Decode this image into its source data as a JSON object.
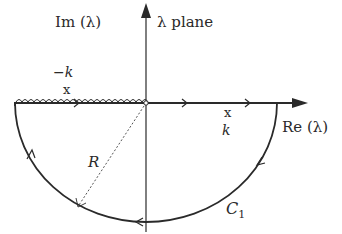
{
  "diagram": {
    "type": "complex-plane contour",
    "plane_label": "λ plane",
    "axes": {
      "imaginary_label": "Im (λ)",
      "real_label": "Re (λ)"
    },
    "points": [
      {
        "label": "−k",
        "marker": "x",
        "position": "negative real axis"
      },
      {
        "label": "k",
        "marker": "x",
        "position": "positive real axis"
      }
    ],
    "contour": {
      "name": "C",
      "subscript": "1",
      "description": "Lower semicircle of radius R, closed along real axis, branch cut (wavy) on negative real axis",
      "radius_label": "R",
      "orientation": "counterclockwise along real axis left-to-right, then arc from right to left through lower half-plane"
    },
    "colors": {
      "line": "#2a2a2a",
      "background": "#ffffff"
    }
  }
}
